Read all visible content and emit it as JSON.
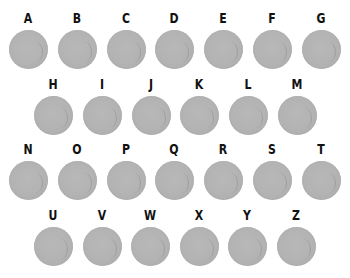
{
  "layout": {
    "rows": [
      {
        "y": 10,
        "letters": [
          "A",
          "B",
          "C",
          "D",
          "E",
          "F",
          "G"
        ],
        "x_start": 6,
        "spacing": 48.8
      },
      {
        "y": 76,
        "letters": [
          "H",
          "I",
          "J",
          "K",
          "L",
          "M"
        ],
        "x_start": 31,
        "spacing": 48.8
      },
      {
        "y": 141,
        "letters": [
          "N",
          "O",
          "P",
          "Q",
          "R",
          "S",
          "T"
        ],
        "x_start": 6,
        "spacing": 48.8
      },
      {
        "y": 207,
        "letters": [
          "U",
          "V",
          "W",
          "X",
          "Y",
          "Z"
        ],
        "x_start": 31,
        "spacing": 48.6
      }
    ]
  },
  "items": [
    {
      "letter": "A"
    },
    {
      "letter": "B"
    },
    {
      "letter": "C"
    },
    {
      "letter": "D"
    },
    {
      "letter": "E"
    },
    {
      "letter": "F"
    },
    {
      "letter": "G"
    },
    {
      "letter": "H"
    },
    {
      "letter": "I"
    },
    {
      "letter": "J"
    },
    {
      "letter": "K"
    },
    {
      "letter": "L"
    },
    {
      "letter": "M"
    },
    {
      "letter": "N"
    },
    {
      "letter": "O"
    },
    {
      "letter": "P"
    },
    {
      "letter": "Q"
    },
    {
      "letter": "R"
    },
    {
      "letter": "S"
    },
    {
      "letter": "T"
    },
    {
      "letter": "U"
    },
    {
      "letter": "V"
    },
    {
      "letter": "W"
    },
    {
      "letter": "X"
    },
    {
      "letter": "Y"
    },
    {
      "letter": "Z"
    }
  ],
  "colors": {
    "circle": "#b3b3b3",
    "label": "#111111",
    "background": "#ffffff"
  }
}
